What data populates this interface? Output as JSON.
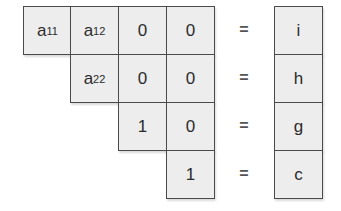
{
  "matrix": {
    "rows": [
      [
        {
          "base": "a",
          "sub": "11"
        },
        {
          "base": "a",
          "sub": "12"
        },
        {
          "base": "0",
          "sub": ""
        },
        {
          "base": "0",
          "sub": ""
        }
      ],
      [
        null,
        {
          "base": "a",
          "sub": "22"
        },
        {
          "base": "0",
          "sub": ""
        },
        {
          "base": "0",
          "sub": ""
        }
      ],
      [
        null,
        null,
        {
          "base": "1",
          "sub": ""
        },
        {
          "base": "0",
          "sub": ""
        }
      ],
      [
        null,
        null,
        null,
        {
          "base": "1",
          "sub": ""
        }
      ]
    ]
  },
  "equals": [
    "=",
    "=",
    "=",
    "="
  ],
  "vector": [
    "i",
    "h",
    "g",
    "c"
  ]
}
